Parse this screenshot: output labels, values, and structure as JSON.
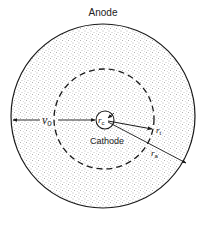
{
  "diagram": {
    "title": "Anode",
    "anode_label": "Anode",
    "cathode_label": "Cathode",
    "labels": {
      "v0": "v",
      "v0_sub": "0",
      "rc": "r",
      "rc_sub": "c",
      "rt": "r",
      "rt_sub": "t",
      "ra": "r",
      "ra_sub": "a"
    },
    "colors": {
      "line": "#1a1a1a",
      "stipple": "#6b6b6b",
      "background": "#ffffff"
    }
  }
}
